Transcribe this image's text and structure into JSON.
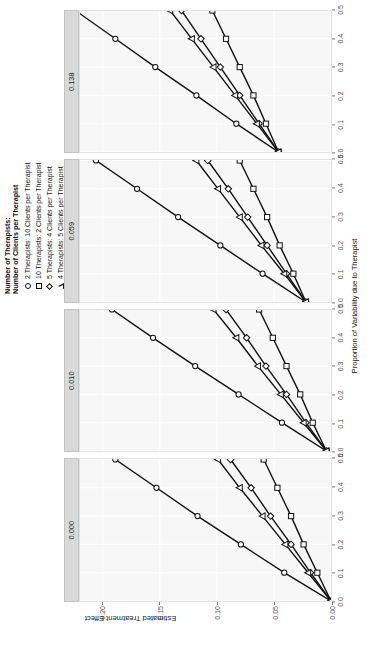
{
  "figure": {
    "x_axis_label": "Proportion of Variability due to Therapist",
    "y_axis_label": "Estimated Treatment Effect"
  },
  "legend": {
    "title_line1": "Number of Therapists:",
    "title_line2": "Number of Clients per Therapist",
    "items": [
      {
        "marker": "circle-marker",
        "label": "2 Therapists: 10 Clients per Therapist"
      },
      {
        "marker": "square-marker",
        "label": "10 Therapists: 2 Clients per Therapist"
      },
      {
        "marker": "diamond-marker",
        "label": "5 Therapists: 4 Clients per Therapist"
      },
      {
        "marker": "triangle-marker",
        "label": "4 Therapists: 5 Clients per Therapist"
      }
    ]
  },
  "panel_strips": [
    "0.000",
    "0.010",
    "0.059",
    "0.138"
  ],
  "x_ticks": [
    "0.0",
    "0.1",
    "0.2",
    "0.3",
    "0.4",
    "0.5"
  ],
  "y_ticks": [
    "0.00",
    "0.05",
    "0.10",
    "0.15",
    "0.20"
  ],
  "colors": {
    "line": "#111111",
    "marker_fill": "#ffffff",
    "panel_background": "#f7f7f7",
    "strip_background": "#d9d9d9",
    "grid": "#ffffff",
    "tick_text": "#555555"
  },
  "chart_data": {
    "type": "line",
    "title": "",
    "subtitle": "",
    "xlabel": "Proportion of Variability due to Therapist",
    "ylabel": "Estimated Treatment Effect",
    "xlim": [
      0.0,
      0.5
    ],
    "ylim": [
      0.0,
      0.22
    ],
    "grid": true,
    "legend_position": "top-right",
    "legend_title": "Number of Therapists: Number of Clients per Therapist",
    "facet_variable": "Intraclass Correlation (ICC)",
    "facet_order": [
      "0.000",
      "0.010",
      "0.059",
      "0.138"
    ],
    "x": [
      0.0,
      0.1,
      0.2,
      0.3,
      0.4,
      0.5
    ],
    "panels": [
      {
        "strip_label": "0.000",
        "series": [
          {
            "name": "2 Therapists: 10 Clients per Therapist",
            "marker": "circle",
            "values": [
              0.0,
              0.041,
              0.079,
              0.117,
              0.153,
              0.189
            ]
          },
          {
            "name": "10 Therapists: 2 Clients per Therapist",
            "marker": "square",
            "values": [
              0.0,
              0.012,
              0.024,
              0.035,
              0.047,
              0.059
            ]
          },
          {
            "name": "5 Therapists: 4 Clients per Therapist",
            "marker": "diamond",
            "values": [
              0.0,
              0.018,
              0.035,
              0.053,
              0.07,
              0.088
            ]
          },
          {
            "name": "4 Therapists: 5 Clients per Therapist",
            "marker": "triangle",
            "values": [
              0.0,
              0.02,
              0.04,
              0.06,
              0.08,
              0.099
            ]
          }
        ]
      },
      {
        "strip_label": "0.010",
        "series": [
          {
            "name": "2 Therapists: 10 Clients per Therapist",
            "marker": "circle",
            "values": [
              0.004,
              0.043,
              0.081,
              0.119,
              0.156,
              0.192
            ]
          },
          {
            "name": "10 Therapists: 2 Clients per Therapist",
            "marker": "square",
            "values": [
              0.004,
              0.016,
              0.027,
              0.039,
              0.051,
              0.063
            ]
          },
          {
            "name": "5 Therapists: 4 Clients per Therapist",
            "marker": "diamond",
            "values": [
              0.004,
              0.022,
              0.039,
              0.057,
              0.074,
              0.092
            ]
          },
          {
            "name": "4 Therapists: 5 Clients per Therapist",
            "marker": "triangle",
            "values": [
              0.004,
              0.024,
              0.044,
              0.064,
              0.083,
              0.103
            ]
          }
        ]
      },
      {
        "strip_label": "0.059",
        "series": [
          {
            "name": "2 Therapists: 10 Clients per Therapist",
            "marker": "circle",
            "values": [
              0.022,
              0.06,
              0.097,
              0.134,
              0.17,
              0.206
            ]
          },
          {
            "name": "10 Therapists: 2 Clients per Therapist",
            "marker": "square",
            "values": [
              0.022,
              0.033,
              0.045,
              0.056,
              0.068,
              0.08
            ]
          },
          {
            "name": "5 Therapists: 4 Clients per Therapist",
            "marker": "diamond",
            "values": [
              0.022,
              0.039,
              0.056,
              0.073,
              0.09,
              0.108
            ]
          },
          {
            "name": "4 Therapists: 5 Clients per Therapist",
            "marker": "triangle",
            "values": [
              0.022,
              0.041,
              0.061,
              0.08,
              0.099,
              0.118
            ]
          }
        ]
      },
      {
        "strip_label": "0.138",
        "series": [
          {
            "name": "2 Therapists: 10 Clients per Therapist",
            "marker": "circle",
            "values": [
              0.046,
              0.083,
              0.118,
              0.154,
              0.189,
              0.224
            ]
          },
          {
            "name": "10 Therapists: 2 Clients per Therapist",
            "marker": "square",
            "values": [
              0.046,
              0.057,
              0.068,
              0.08,
              0.092,
              0.104
            ]
          },
          {
            "name": "5 Therapists: 4 Clients per Therapist",
            "marker": "diamond",
            "values": [
              0.046,
              0.063,
              0.08,
              0.097,
              0.114,
              0.131
            ]
          },
          {
            "name": "4 Therapists: 5 Clients per Therapist",
            "marker": "triangle",
            "values": [
              0.046,
              0.065,
              0.084,
              0.103,
              0.122,
              0.141
            ]
          }
        ]
      }
    ]
  }
}
